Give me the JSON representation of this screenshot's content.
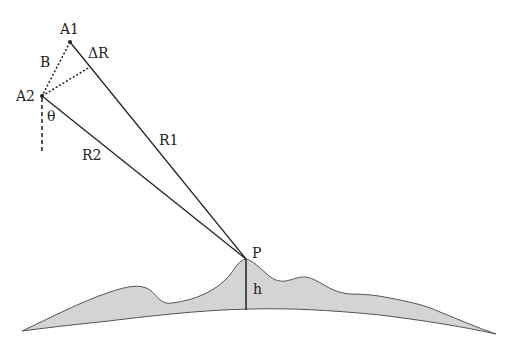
{
  "diagram": {
    "labels": {
      "antenna1": "A1",
      "antenna2": "A2",
      "baseline": "B",
      "delta_range": "ΔR",
      "look_angle": "θ",
      "range1": "R1",
      "range2": "R2",
      "target": "P",
      "height": "h"
    },
    "colors": {
      "line": "#222222",
      "terrain_fill": "#d4d4d4",
      "terrain_stroke": "#555555",
      "background": "#ffffff"
    }
  }
}
